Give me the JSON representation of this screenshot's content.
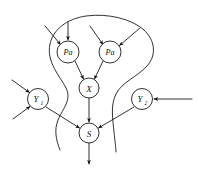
{
  "diagram": {
    "background_color": "#ffffff",
    "stroke_color": "#1a1a1a",
    "nodes": [
      {
        "id": "pa1",
        "label": "Pa",
        "subscript": "",
        "cx": 68,
        "cy": 52,
        "r": 11
      },
      {
        "id": "pa2",
        "label": "Pa",
        "subscript": "",
        "cx": 110,
        "cy": 52,
        "r": 11
      },
      {
        "id": "x",
        "label": "X",
        "subscript": "",
        "cx": 89,
        "cy": 88,
        "r": 10
      },
      {
        "id": "y1",
        "label": "Y",
        "subscript": "1",
        "cx": 38,
        "cy": 99,
        "r": 10.5
      },
      {
        "id": "y2",
        "label": "Y",
        "subscript": "2",
        "cx": 142,
        "cy": 99,
        "r": 10.5
      },
      {
        "id": "s",
        "label": "S",
        "subscript": "",
        "cx": 89,
        "cy": 133,
        "r": 10
      }
    ],
    "edges": [
      {
        "from": "external-upper-left-1",
        "to": "pa1",
        "kind": "incoming-external"
      },
      {
        "from": "external-above-1",
        "to": "pa1",
        "kind": "incoming-external"
      },
      {
        "from": "external-upper-left-2",
        "to": "pa2",
        "kind": "incoming-external"
      },
      {
        "from": "external-upper-right-2",
        "to": "pa2",
        "kind": "incoming-external"
      },
      {
        "from": "pa1",
        "to": "x",
        "kind": "internal"
      },
      {
        "from": "pa2",
        "to": "x",
        "kind": "internal"
      },
      {
        "from": "x",
        "to": "s",
        "kind": "internal"
      },
      {
        "from": "external-upper-left-y1",
        "to": "y1",
        "kind": "incoming-external"
      },
      {
        "from": "external-lower-left-y1",
        "to": "y1",
        "kind": "incoming-external"
      },
      {
        "from": "external-right-y2",
        "to": "y2",
        "kind": "incoming-external"
      },
      {
        "from": "y1",
        "to": "s",
        "kind": "internal"
      },
      {
        "from": "y2",
        "to": "s",
        "kind": "internal"
      },
      {
        "from": "s",
        "to": "external-below",
        "kind": "outgoing-external"
      }
    ],
    "boundary": {
      "name": "enclosing-region",
      "description": "open bulb-shaped curve enclosing Pa, Pa, X and S, narrowing at the bottom"
    }
  }
}
